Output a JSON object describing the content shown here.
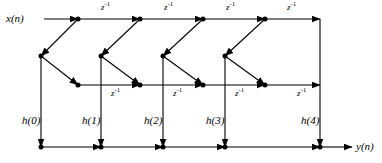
{
  "diagram": {
    "type": "signal-flow-graph",
    "stroke_color": "#000000",
    "background_color": "#ffffff",
    "input_label": "x(n)",
    "output_label": "y(n)",
    "delay_label": "z",
    "delay_exponent": "-1",
    "coefficients": [
      {
        "label": "h(0)"
      },
      {
        "label": "h(1)"
      },
      {
        "label": "h(2)"
      },
      {
        "label": "h(3)"
      },
      {
        "label": "h(4)"
      }
    ],
    "delays_top": [
      {
        "label": "z",
        "exponent": "-1"
      },
      {
        "label": "z",
        "exponent": "-1"
      },
      {
        "label": "z",
        "exponent": "-1"
      },
      {
        "label": "z",
        "exponent": "-1"
      }
    ],
    "delays_middle": [
      {
        "label": "z",
        "exponent": "-1"
      },
      {
        "label": "z",
        "exponent": "-1"
      },
      {
        "label": "z",
        "exponent": "-1"
      },
      {
        "label": "z",
        "exponent": "-1"
      }
    ],
    "rows": {
      "top_y": 19,
      "adder_y": 56,
      "middle_y": 85,
      "bottom_y": 147
    },
    "node_columns_top": [
      78,
      140,
      203,
      265,
      320
    ],
    "node_columns_adder": [
      41,
      101,
      163,
      225
    ],
    "node_columns_middle": [
      78,
      140,
      203,
      265
    ],
    "node_columns_bottom": [
      41,
      101,
      163,
      225,
      320
    ]
  }
}
